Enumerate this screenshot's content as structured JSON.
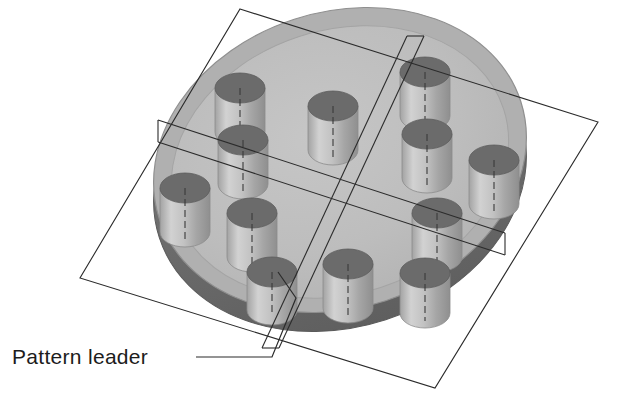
{
  "figure": {
    "type": "engineering-isometric-diagram",
    "background_color": "#ffffff"
  },
  "annotation": {
    "label": "Pattern leader",
    "label_x": 12,
    "label_y": 364,
    "text_color": "#1c1c1c",
    "leader_line_color": "#2b2b2b",
    "leader_path": "M 196 357 L 272 357 L 296 298 L 278 272"
  },
  "disc": {
    "name": "circular-plate",
    "center_x": 340,
    "center_y": 160,
    "radius_x": 190,
    "radius_y": 148,
    "rotation_deg": -18,
    "rim_thickness": 19,
    "top_face_color": "#bfbfbf",
    "top_face_edge_color": "#a8a8a8",
    "rim_color": "#6e6e6e",
    "side_color": "#8f8f8f",
    "outline_color": "#8a8a8a"
  },
  "pins": {
    "name": "cylindrical-pins",
    "count": 12,
    "top_ellipse_color": "#6b6b6b",
    "body_light_color": "#cfcfcf",
    "body_mid_color": "#b5b5b5",
    "body_dark_color": "#9a9a9a",
    "centerline_color": "#3a3a3a",
    "radius_x": 25,
    "radius_y": 15,
    "height": 44,
    "positions": [
      {
        "id": "pin-1",
        "x": 240,
        "y": 88,
        "label": "upper-left-outer"
      },
      {
        "id": "pin-2",
        "x": 333,
        "y": 106,
        "label": "upper-mid"
      },
      {
        "id": "pin-3",
        "x": 425,
        "y": 72,
        "label": "upper-right-leaderpoint"
      },
      {
        "id": "pin-4",
        "x": 427,
        "y": 134,
        "label": "right-upper-inner"
      },
      {
        "id": "pin-5",
        "x": 494,
        "y": 160,
        "label": "right-outer"
      },
      {
        "id": "pin-6",
        "x": 243,
        "y": 140,
        "label": "left-inner-upper"
      },
      {
        "id": "pin-7",
        "x": 185,
        "y": 188,
        "label": "left-outer"
      },
      {
        "id": "pin-8",
        "x": 252,
        "y": 213,
        "label": "left-lower-inner"
      },
      {
        "id": "pin-9",
        "x": 437,
        "y": 213,
        "label": "right-lower-inner"
      },
      {
        "id": "pin-10",
        "x": 272,
        "y": 272,
        "label": "bottom-left-pattern-leader"
      },
      {
        "id": "pin-11",
        "x": 348,
        "y": 264,
        "label": "bottom-mid"
      },
      {
        "id": "pin-12",
        "x": 425,
        "y": 273,
        "label": "bottom-right"
      }
    ]
  },
  "plane": {
    "name": "overlay-reference-plane",
    "line_color": "#2b2b2b",
    "line_width": 1.1,
    "corners": [
      {
        "x": 240,
        "y": 9
      },
      {
        "x": 598,
        "y": 122
      },
      {
        "x": 435,
        "y": 388
      },
      {
        "x": 80,
        "y": 278
      }
    ]
  },
  "bands": {
    "name": "reference-axis-bands",
    "line_color": "#2b2b2b",
    "horizontal_band": {
      "top_line": {
        "x1": 158,
        "y1": 120,
        "x2": 505,
        "y2": 233
      },
      "bottom_line": {
        "x1": 158,
        "y1": 142,
        "x2": 505,
        "y2": 255
      },
      "cap_left": {
        "x1": 158,
        "y1": 120,
        "x2": 158,
        "y2": 142
      },
      "cap_right": {
        "x1": 505,
        "y1": 233,
        "x2": 505,
        "y2": 255
      }
    },
    "diagonal_band": {
      "left_line": {
        "x1": 407,
        "y1": 36,
        "x2": 262,
        "y2": 348
      },
      "right_line": {
        "x1": 424,
        "y1": 36,
        "x2": 279,
        "y2": 348
      },
      "cap_top": {
        "x1": 407,
        "y1": 36,
        "x2": 424,
        "y2": 36
      },
      "cap_bottom": {
        "x1": 262,
        "y1": 348,
        "x2": 279,
        "y2": 348
      }
    }
  }
}
